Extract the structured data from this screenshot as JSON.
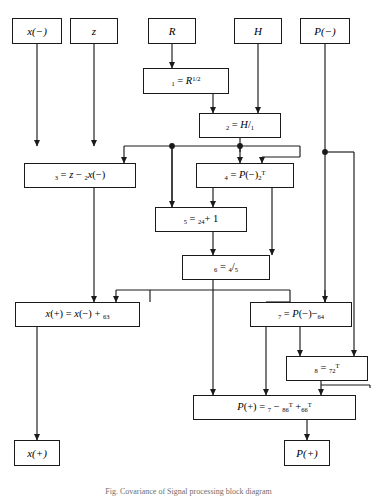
{
  "figure": {
    "type": "signal-flow-diagram",
    "caption": "Fig. Covariance of Signal processing block diagram",
    "stroke_color": "#1a1a1a",
    "background_color": "#ffffff"
  },
  "inputs": [
    {
      "id": "x-minus",
      "label": "x(−)"
    },
    {
      "id": "z",
      "label": "z"
    },
    {
      "id": "R",
      "label": "R"
    },
    {
      "id": "H",
      "label": "H"
    },
    {
      "id": "P-minus",
      "label": "P(−)"
    }
  ],
  "process_blocks": [
    {
      "id": "T1",
      "label": "𝒯₁ = R^(1/2)"
    },
    {
      "id": "T2",
      "label": "𝒯₂ = H/𝒯₁"
    },
    {
      "id": "T3",
      "label": "𝒯₃ = z − 𝒯₂x(−)"
    },
    {
      "id": "T4",
      "label": "𝒯₄ = P(−)𝒯₂ᵀ"
    },
    {
      "id": "T5",
      "label": "𝒯₅ = 𝒯₂𝒯₄ + 1"
    },
    {
      "id": "T6",
      "label": "𝒯₆ = 𝒯₄/𝒯₅"
    },
    {
      "id": "x-plus-eq",
      "label": "x(+) = x(−) + 𝒯₆𝒯₃"
    },
    {
      "id": "T7",
      "label": "𝒯₇ = P(−) − 𝒯₆𝒯₄"
    },
    {
      "id": "T8",
      "label": "𝒯₈ = 𝒯₇𝒯₂ᵀ"
    },
    {
      "id": "P-plus-eq",
      "label": "P(+) = 𝒯₇ − 𝒯₈𝒯₆ᵀ + 𝒯₆𝒯₆ᵀ"
    }
  ],
  "outputs": [
    {
      "id": "x-plus",
      "label": "x(+)"
    },
    {
      "id": "P-plus",
      "label": "P(+)"
    }
  ]
}
